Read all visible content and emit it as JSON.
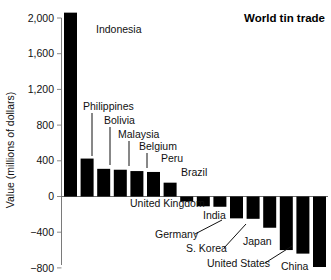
{
  "chart_data": {
    "type": "bar",
    "title": "World tin trade",
    "xlabel": "",
    "ylabel": "Value (millions of dollars)",
    "ylim": [
      -800,
      2200
    ],
    "yticks": [
      2000,
      1600,
      1200,
      800,
      400,
      0,
      -400,
      -800
    ],
    "ytick_labels": [
      "2,000",
      "1,600",
      "1,200",
      "800",
      "400",
      "0",
      "−400",
      "−800"
    ],
    "grid": false,
    "legend": "none",
    "categories": [
      "Indonesia",
      "Philippines",
      "Bolivia",
      "Malaysia",
      "Belgium",
      "Peru",
      "Brazil",
      "United Kingdom",
      "India",
      "Germany",
      "S. Korea",
      "Japan",
      "United States",
      "China",
      "",
      ""
    ],
    "values": [
      2060,
      425,
      310,
      300,
      285,
      275,
      155,
      -55,
      -110,
      -115,
      -245,
      -250,
      -350,
      -600,
      -640,
      -790
    ],
    "bars": [
      {
        "label": "Indonesia",
        "value": 2060,
        "label_x": 96,
        "label_y": 33,
        "leader": false
      },
      {
        "label": "Philippines",
        "value": 425,
        "label_x": 83,
        "label_y": 110,
        "leader": true,
        "leader_x": 92,
        "leader_y1": 113,
        "leader_y2": 156
      },
      {
        "label": "Bolivia",
        "value": 310,
        "label_x": 104,
        "label_y": 124,
        "leader": true,
        "leader_x": 110,
        "leader_y1": 127,
        "leader_y2": 165
      },
      {
        "label": "Malaysia",
        "value": 300,
        "label_x": 118,
        "label_y": 138,
        "leader": true,
        "leader_x": 129,
        "leader_y1": 141,
        "leader_y2": 166
      },
      {
        "label": "Belgium",
        "value": 285,
        "label_x": 139,
        "label_y": 150,
        "leader": true,
        "leader_x": 147,
        "leader_y1": 153,
        "leader_y2": 168
      },
      {
        "label": "Peru",
        "value": 275,
        "label_x": 161,
        "label_y": 162,
        "leader": false
      },
      {
        "label": "Brazil",
        "value": 155,
        "label_x": 181,
        "label_y": 176,
        "leader": false
      },
      {
        "label": "United Kingdom",
        "value": -55,
        "label_x": 130,
        "label_y": 207,
        "leader": false
      },
      {
        "label": "India",
        "value": -110,
        "label_x": 203,
        "label_y": 219,
        "leader": false
      },
      {
        "label": "Germany",
        "value": -115,
        "label_x": 155,
        "label_y": 238,
        "leader": true,
        "lx1": 195,
        "ly1": 234,
        "lx2": 222,
        "ly2": 220
      },
      {
        "label": "S. Korea",
        "value": -245,
        "label_x": 186,
        "label_y": 252,
        "leader": true,
        "lx1": 224,
        "ly1": 248,
        "lx2": 246,
        "ly2": 224
      },
      {
        "label": "Japan",
        "value": -250,
        "label_x": 243,
        "label_y": 245,
        "leader": false
      },
      {
        "label": "United States",
        "value": -350,
        "label_x": 207,
        "label_y": 267,
        "leader": true,
        "lx1": 265,
        "ly1": 263,
        "lx2": 292,
        "ly2": 246
      },
      {
        "label": "China",
        "value": -790,
        "label_x": 281,
        "label_y": 270,
        "leader": false
      }
    ]
  }
}
